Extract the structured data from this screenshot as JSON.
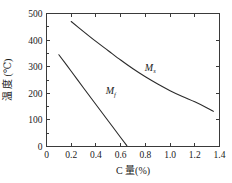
{
  "chart_data": {
    "type": "line",
    "title": "",
    "xlabel": "C 量(%)",
    "ylabel": "温 度 (℃)",
    "xlim": [
      0,
      1.4
    ],
    "ylim": [
      0,
      500
    ],
    "xticks": [
      "0",
      "0.2",
      "0.4",
      "0.6",
      "0.8",
      "1.0",
      "1.2",
      "1.4"
    ],
    "xtick_values": [
      0,
      0.2,
      0.4,
      0.6,
      0.8,
      1.0,
      1.2,
      1.4
    ],
    "yticks": [
      "0",
      "100",
      "200",
      "300",
      "400",
      "500"
    ],
    "ytick_values": [
      0,
      100,
      200,
      300,
      400,
      500
    ],
    "grid": false,
    "legend": "none",
    "series": [
      {
        "name": "Ms",
        "label_text": "M",
        "label_sub": "s",
        "label_x": 0.84,
        "label_y": 285,
        "x": [
          0.2,
          0.3,
          0.4,
          0.5,
          0.6,
          0.7,
          0.8,
          0.9,
          1.0,
          1.1,
          1.2,
          1.3,
          1.35
        ],
        "y": [
          470,
          432,
          395,
          360,
          325,
          292,
          262,
          235,
          210,
          188,
          168,
          145,
          132
        ]
      },
      {
        "name": "Mf",
        "label_text": "M",
        "label_sub": "f",
        "label_x": 0.52,
        "label_y": 196,
        "x": [
          0.1,
          0.2,
          0.3,
          0.4,
          0.5,
          0.6,
          0.65
        ],
        "y": [
          345,
          283,
          220,
          158,
          96,
          34,
          3
        ]
      }
    ],
    "annotations": [
      {
        "text": "Ms",
        "meaning": "martensite-start-curve"
      },
      {
        "text": "Mf",
        "meaning": "martensite-finish-curve"
      }
    ],
    "colors": {
      "curve": "#2b2b2b",
      "axis": "#3a3a3a",
      "text": "#1a1a1a",
      "background": "#ffffff"
    }
  }
}
